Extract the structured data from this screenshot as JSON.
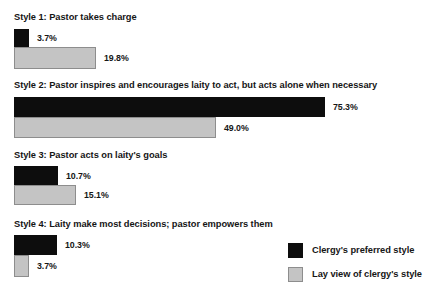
{
  "chart_data": {
    "type": "bar",
    "orientation": "horizontal",
    "title": "",
    "xlabel": "",
    "ylabel": "",
    "xlim": [
      0,
      80
    ],
    "grid": false,
    "legend_position": "bottom-right",
    "categories": [
      "Style 1: Pastor takes charge",
      "Style 2: Pastor inspires and encourages laity to act, but acts alone when necessary",
      "Style 3: Pastor acts on laity's goals",
      "Style 4: Laity make most decisions; pastor empowers them"
    ],
    "series": [
      {
        "name": "Clergy's preferred style",
        "color": "#0d0d0d",
        "values": [
          3.7,
          75.3,
          10.7,
          10.3
        ],
        "labels": [
          "3.7%",
          "75.3%",
          "10.7%",
          "10.3%"
        ]
      },
      {
        "name": "Lay view of clergy's style",
        "color": "#c4c4c4",
        "values": [
          19.8,
          49.0,
          15.1,
          3.7
        ],
        "labels": [
          "19.8%",
          "49.0%",
          "15.1%",
          "3.7%"
        ]
      }
    ]
  },
  "legend": {
    "items": [
      {
        "label": "Clergy's preferred style",
        "swatch": "clergy"
      },
      {
        "label": "Lay view of clergy's style",
        "swatch": "lay"
      }
    ]
  },
  "groups": [
    {
      "label": "Style 1: Pastor takes charge",
      "label_top": 12,
      "bars": [
        {
          "series": "clergy",
          "value": 3.7,
          "label": "3.7%",
          "top": 29,
          "height": 18
        },
        {
          "series": "lay",
          "value": 19.8,
          "label": "19.8%",
          "top": 47,
          "height": 22
        }
      ]
    },
    {
      "label": "Style 2: Pastor inspires and encourages laity to act, but acts alone when necessary",
      "label_top": 80,
      "bars": [
        {
          "series": "clergy",
          "value": 75.3,
          "label": "75.3%",
          "top": 97,
          "height": 20
        },
        {
          "series": "lay",
          "value": 49.0,
          "label": "49.0%",
          "top": 117,
          "height": 21
        }
      ]
    },
    {
      "label": "Style 3: Pastor acts on laity's goals",
      "label_top": 150,
      "bars": [
        {
          "series": "clergy",
          "value": 10.7,
          "label": "10.7%",
          "top": 166,
          "height": 19
        },
        {
          "series": "lay",
          "value": 15.1,
          "label": "15.1%",
          "top": 185,
          "height": 20
        }
      ]
    },
    {
      "label": "Style 4: Laity make most decisions; pastor empowers them",
      "label_top": 219,
      "bars": [
        {
          "series": "clergy",
          "value": 10.3,
          "label": "10.3%",
          "top": 235,
          "height": 20
        },
        {
          "series": "lay",
          "value": 3.7,
          "label": "3.7%",
          "top": 255,
          "height": 22
        }
      ]
    }
  ],
  "scale": {
    "px_per_percent": 4.13,
    "origin_x": 14
  }
}
